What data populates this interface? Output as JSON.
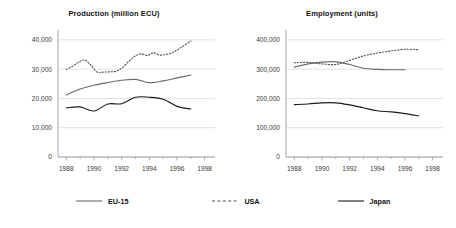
{
  "chart_data": [
    {
      "type": "line",
      "title": "Production (million ECU)",
      "xlabel": "",
      "ylabel": "",
      "xlim": [
        1987.4,
        1998.6
      ],
      "ylim": [
        0,
        42000
      ],
      "yticks": [
        0,
        10000,
        20000,
        30000,
        40000
      ],
      "ytick_labels": [
        "0",
        "10,000",
        "20,000",
        "30,000",
        "40,000"
      ],
      "xticks": [
        1988,
        1990,
        1992,
        1994,
        1996,
        1998
      ],
      "xtick_labels": [
        "1988",
        "1990",
        "1992",
        "1994",
        "1996",
        "1998"
      ],
      "grid": "horizontal",
      "legend_position": "below-figure",
      "series": [
        {
          "name": "EU-15",
          "style": "solid",
          "color": "#6b6b6b",
          "x": [
            1988,
            1989,
            1990,
            1991,
            1992,
            1993,
            1994,
            1995,
            1996,
            1997
          ],
          "values": [
            21200,
            23200,
            24500,
            25400,
            26200,
            26500,
            25400,
            26000,
            27000,
            28000
          ]
        },
        {
          "name": "USA",
          "style": "dotted",
          "color": "#555555",
          "x": [
            1988,
            1989,
            1990,
            1991,
            1992,
            1993,
            1994,
            1995,
            1996,
            1997
          ],
          "values": [
            29900,
            32400,
            33100,
            28900,
            29100,
            29300,
            31400,
            34900,
            35300,
            36200
          ],
          "values_detail": [
            29900,
            31000,
            32400,
            33100,
            31200,
            28900,
            29000,
            29100,
            29300,
            30500,
            32600,
            34400,
            35200,
            34700,
            35600,
            34800,
            35000,
            35600,
            36800,
            38200,
            39600
          ]
        },
        {
          "name": "Japan",
          "style": "solid",
          "color": "#1c1c1c",
          "x": [
            1988,
            1989,
            1990,
            1991,
            1992,
            1993,
            1994,
            1995,
            1996,
            1997
          ],
          "values": [
            16800,
            17100,
            15700,
            18100,
            18200,
            20400,
            20400,
            19700,
            17300,
            16400
          ]
        }
      ]
    },
    {
      "type": "line",
      "title": "Employment (units)",
      "xlabel": "",
      "ylabel": "",
      "xlim": [
        1987.4,
        1998.6
      ],
      "ylim": [
        0,
        420000
      ],
      "yticks": [
        0,
        100000,
        200000,
        300000,
        400000
      ],
      "ytick_labels": [
        "0",
        "100,000",
        "200,000",
        "300,000",
        "400,000"
      ],
      "xticks": [
        1988,
        1990,
        1992,
        1994,
        1996,
        1998
      ],
      "xtick_labels": [
        "1988",
        "1990",
        "1992",
        "1994",
        "1996",
        "1998"
      ],
      "grid": "horizontal",
      "legend_position": "below-figure",
      "series": [
        {
          "name": "EU-15",
          "style": "solid",
          "color": "#6b6b6b",
          "x": [
            1988,
            1989,
            1990,
            1991,
            1992,
            1993,
            1994,
            1995,
            1996
          ],
          "values": [
            307000,
            318000,
            324000,
            325000,
            316000,
            303000,
            299000,
            298000,
            298000
          ]
        },
        {
          "name": "USA",
          "style": "dotted",
          "color": "#555555",
          "x": [
            1988,
            1989,
            1990,
            1991,
            1992,
            1993,
            1994,
            1995,
            1996,
            1997
          ],
          "values": [
            322000,
            323000,
            318000,
            316000,
            330000,
            345000,
            355000,
            362000,
            368000,
            366000
          ]
        },
        {
          "name": "Japan",
          "style": "solid",
          "color": "#1c1c1c",
          "x": [
            1988,
            1989,
            1990,
            1991,
            1992,
            1993,
            1994,
            1995,
            1996,
            1997
          ],
          "values": [
            179000,
            181000,
            185000,
            185000,
            178000,
            168000,
            158000,
            154000,
            148000,
            140000
          ]
        }
      ]
    }
  ],
  "legend": {
    "items": [
      {
        "label": "EU-15",
        "style": "solid",
        "color": "#6b6b6b"
      },
      {
        "label": "USA",
        "style": "dotted",
        "color": "#555555"
      },
      {
        "label": "Japan",
        "style": "solid",
        "color": "#1c1c1c"
      }
    ]
  },
  "axis_colors": {
    "grid": "#d9d9d9",
    "axis": "#9a9a9a",
    "tick_text": "#3a3a3a"
  }
}
